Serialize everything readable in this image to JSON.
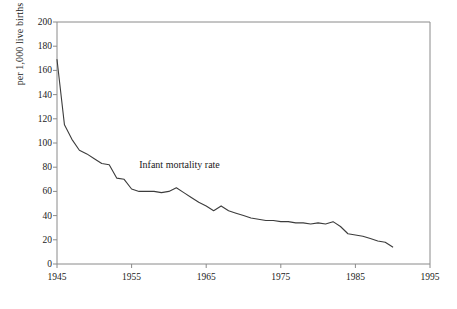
{
  "chart_data": {
    "type": "line",
    "title": "",
    "xlabel": "",
    "ylabel": "per 1,000 live births",
    "xlim": [
      1945,
      1995
    ],
    "ylim": [
      0,
      200
    ],
    "xticks": [
      1945,
      1955,
      1965,
      1975,
      1985,
      1995
    ],
    "yticks": [
      0,
      20,
      40,
      60,
      80,
      100,
      120,
      140,
      160,
      180,
      200
    ],
    "grid": false,
    "legend": "inline-annotation",
    "annotations": [
      {
        "text": "Infant mortality rate",
        "x": 1963,
        "y": 82
      }
    ],
    "series": [
      {
        "name": "Infant mortality rate",
        "color": "#3c3c3c",
        "x": [
          1945,
          1946,
          1947,
          1948,
          1949,
          1950,
          1951,
          1952,
          1953,
          1954,
          1955,
          1956,
          1957,
          1958,
          1959,
          1960,
          1961,
          1962,
          1963,
          1964,
          1965,
          1966,
          1967,
          1968,
          1969,
          1970,
          1971,
          1972,
          1973,
          1974,
          1975,
          1976,
          1977,
          1978,
          1979,
          1980,
          1981,
          1982,
          1983,
          1984,
          1985,
          1986,
          1987,
          1988,
          1989,
          1990
        ],
        "values": [
          169,
          115,
          103,
          94,
          91,
          87,
          83,
          82,
          71,
          70,
          62,
          60,
          60,
          60,
          59,
          60,
          63,
          59,
          55,
          51,
          48,
          44,
          48,
          44,
          42,
          40,
          38,
          37,
          36,
          36,
          35,
          35,
          34,
          34,
          33,
          34,
          33,
          35,
          31,
          25,
          24,
          23,
          21,
          19,
          18,
          14
        ],
        "units": "deaths per 1,000 live births"
      }
    ]
  },
  "geometry": {
    "plot_left": 57,
    "plot_right": 430,
    "plot_top": 22,
    "plot_bottom": 264
  }
}
